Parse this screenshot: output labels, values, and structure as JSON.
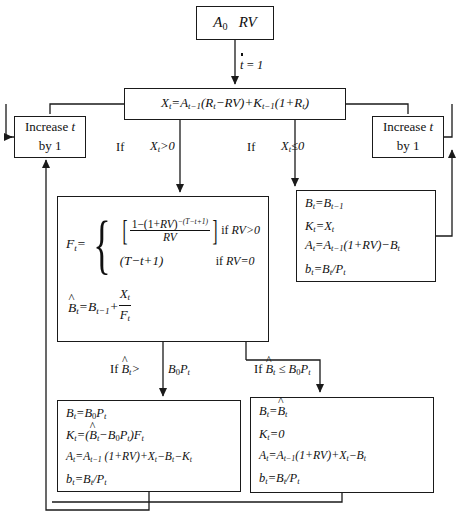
{
  "diagram": {
    "nodes": {
      "start": {
        "text": "A₀   RV"
      },
      "init_label": {
        "text": "t = 1"
      },
      "main_eq": {
        "text": "X_t = A_{t-1}(R_t − RV) + K_{t-1}(1 + R_t)"
      },
      "increase_left": {
        "line1": "Increase t",
        "line2": "by 1"
      },
      "increase_right": {
        "line1": "Increase t",
        "line2": "by 1"
      },
      "f_box": {
        "case1": "[1 − (1 + RV)^{−(T − t + 1)}] / RV",
        "case1_cond": "if RV > 0",
        "case2": "(T − t + 1)",
        "case2_cond": "if RV = 0",
        "bhat": "B̂_t = B_{t-1} + X_t / F_t"
      },
      "right_box": {
        "l1": "B_t = B_{t-1}",
        "l2": "K_t = X_t",
        "l3": "A_t = A_{t-1}(1 + RV) − B_t",
        "l4": "b_t = B_t / P_t"
      },
      "bottom_left": {
        "l1": "B_t = B₀P_t",
        "l2": "K_t = (B̂_t − B₀P_t)F_t",
        "l3": "A_t = A_{t-1} (1 + RV) + X_t − B_t − K_t",
        "l4": "b_t = B_t / P_t"
      },
      "bottom_right": {
        "l1": "B_t = B̂_t",
        "l2": "K_t = 0",
        "l3": "A_t = A_{t-1}(1 + RV) + X_t − B_t",
        "l4": "b_t = B_t / P_t"
      }
    },
    "edge_labels": {
      "if_left": "If",
      "cond_left": "X_t > 0",
      "if_right": "If",
      "cond_right": "X_t ≤ 0",
      "if_b_left": "If B̂_t >",
      "cond_b_left": "B₀P_t",
      "if_b_right": "If B̂_t ≤ B₀P_t"
    },
    "colors": {
      "stroke": "#1a1a1a",
      "background": "#ffffff"
    }
  }
}
